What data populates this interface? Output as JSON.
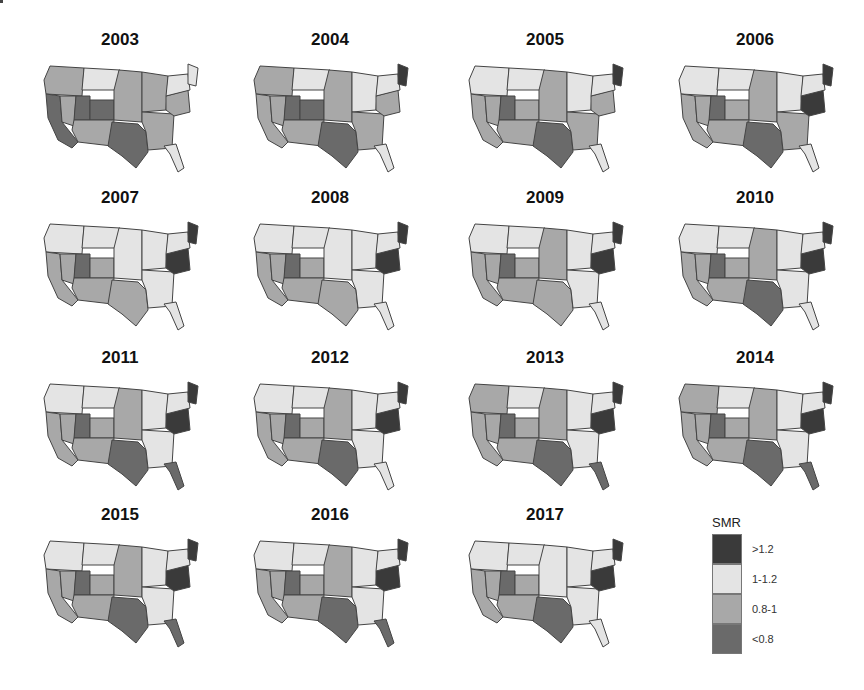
{
  "chart_data": {
    "type": "choropleth-small-multiples",
    "title": "",
    "legend": {
      "title": "SMR",
      "categories": [
        {
          "label": ">1.2",
          "color": "#3a3a3a"
        },
        {
          "label": "1-1.2",
          "color": "#e4e4e4"
        },
        {
          "label": "0.8-1",
          "color": "#a8a8a8"
        },
        {
          "label": "<0.8",
          "color": "#6a6a6a"
        }
      ]
    },
    "panels": [
      {
        "year": "2003",
        "regions": {
          "northwest": "0.8-1",
          "montana": "1-1.2",
          "california": "<0.8",
          "nevada": "0.8-1",
          "utah": "<0.8",
          "colorado": "<0.8",
          "southwest": "0.8-1",
          "texas": "<0.8",
          "plains": "0.8-1",
          "midwest": "0.8-1",
          "south": "0.8-1",
          "florida": "1-1.2",
          "appalachia": "0.8-1",
          "northeast": "1-1.2",
          "maine": "1-1.2"
        }
      },
      {
        "year": "2004",
        "regions": {
          "northwest": "0.8-1",
          "montana": "1-1.2",
          "california": "0.8-1",
          "nevada": "0.8-1",
          "utah": "<0.8",
          "colorado": "<0.8",
          "southwest": "0.8-1",
          "texas": "<0.8",
          "plains": "0.8-1",
          "midwest": "1-1.2",
          "south": "0.8-1",
          "florida": "1-1.2",
          "appalachia": "0.8-1",
          "northeast": "1-1.2",
          "maine": ">1.2"
        }
      },
      {
        "year": "2005",
        "regions": {
          "northwest": "1-1.2",
          "montana": "1-1.2",
          "california": "0.8-1",
          "nevada": "0.8-1",
          "utah": "<0.8",
          "colorado": "0.8-1",
          "southwest": "0.8-1",
          "texas": "<0.8",
          "plains": "0.8-1",
          "midwest": "1-1.2",
          "south": "0.8-1",
          "florida": "1-1.2",
          "appalachia": "0.8-1",
          "northeast": "1-1.2",
          "maine": ">1.2"
        }
      },
      {
        "year": "2006",
        "regions": {
          "northwest": "1-1.2",
          "montana": "1-1.2",
          "california": "0.8-1",
          "nevada": "0.8-1",
          "utah": "<0.8",
          "colorado": "0.8-1",
          "southwest": "0.8-1",
          "texas": "<0.8",
          "plains": "0.8-1",
          "midwest": "1-1.2",
          "south": "0.8-1",
          "florida": "1-1.2",
          "appalachia": ">1.2",
          "northeast": "1-1.2",
          "maine": ">1.2"
        }
      },
      {
        "year": "2007",
        "regions": {
          "northwest": "1-1.2",
          "montana": "1-1.2",
          "california": "0.8-1",
          "nevada": "0.8-1",
          "utah": "<0.8",
          "colorado": "0.8-1",
          "southwest": "0.8-1",
          "texas": "0.8-1",
          "plains": "1-1.2",
          "midwest": "1-1.2",
          "south": "1-1.2",
          "florida": "1-1.2",
          "appalachia": ">1.2",
          "northeast": "1-1.2",
          "maine": ">1.2"
        }
      },
      {
        "year": "2008",
        "regions": {
          "northwest": "1-1.2",
          "montana": "1-1.2",
          "california": "0.8-1",
          "nevada": "0.8-1",
          "utah": "<0.8",
          "colorado": "0.8-1",
          "southwest": "0.8-1",
          "texas": "0.8-1",
          "plains": "1-1.2",
          "midwest": "1-1.2",
          "south": "1-1.2",
          "florida": "1-1.2",
          "appalachia": ">1.2",
          "northeast": "1-1.2",
          "maine": ">1.2"
        }
      },
      {
        "year": "2009",
        "regions": {
          "northwest": "1-1.2",
          "montana": "1-1.2",
          "california": "0.8-1",
          "nevada": "0.8-1",
          "utah": "<0.8",
          "colorado": "0.8-1",
          "southwest": "0.8-1",
          "texas": "0.8-1",
          "plains": "0.8-1",
          "midwest": "1-1.2",
          "south": "1-1.2",
          "florida": "1-1.2",
          "appalachia": ">1.2",
          "northeast": "1-1.2",
          "maine": ">1.2"
        }
      },
      {
        "year": "2010",
        "regions": {
          "northwest": "1-1.2",
          "montana": "1-1.2",
          "california": "0.8-1",
          "nevada": "0.8-1",
          "utah": "<0.8",
          "colorado": "0.8-1",
          "southwest": "0.8-1",
          "texas": "<0.8",
          "plains": "0.8-1",
          "midwest": "1-1.2",
          "south": "1-1.2",
          "florida": "1-1.2",
          "appalachia": ">1.2",
          "northeast": "1-1.2",
          "maine": ">1.2"
        }
      },
      {
        "year": "2011",
        "regions": {
          "northwest": "1-1.2",
          "montana": "1-1.2",
          "california": "0.8-1",
          "nevada": "0.8-1",
          "utah": "<0.8",
          "colorado": "0.8-1",
          "southwest": "0.8-1",
          "texas": "<0.8",
          "plains": "0.8-1",
          "midwest": "1-1.2",
          "south": "1-1.2",
          "florida": "<0.8",
          "appalachia": ">1.2",
          "northeast": "1-1.2",
          "maine": ">1.2"
        }
      },
      {
        "year": "2012",
        "regions": {
          "northwest": "1-1.2",
          "montana": "1-1.2",
          "california": "0.8-1",
          "nevada": "0.8-1",
          "utah": "<0.8",
          "colorado": "0.8-1",
          "southwest": "0.8-1",
          "texas": "<0.8",
          "plains": "0.8-1",
          "midwest": "1-1.2",
          "south": "1-1.2",
          "florida": "1-1.2",
          "appalachia": ">1.2",
          "northeast": "1-1.2",
          "maine": ">1.2"
        }
      },
      {
        "year": "2013",
        "regions": {
          "northwest": "0.8-1",
          "montana": "1-1.2",
          "california": "0.8-1",
          "nevada": "0.8-1",
          "utah": "<0.8",
          "colorado": "0.8-1",
          "southwest": "0.8-1",
          "texas": "<0.8",
          "plains": "0.8-1",
          "midwest": "1-1.2",
          "south": "1-1.2",
          "florida": "<0.8",
          "appalachia": ">1.2",
          "northeast": "1-1.2",
          "maine": ">1.2"
        }
      },
      {
        "year": "2014",
        "regions": {
          "northwest": "0.8-1",
          "montana": "1-1.2",
          "california": "0.8-1",
          "nevada": "0.8-1",
          "utah": "<0.8",
          "colorado": "0.8-1",
          "southwest": "0.8-1",
          "texas": "<0.8",
          "plains": "0.8-1",
          "midwest": "1-1.2",
          "south": "1-1.2",
          "florida": "<0.8",
          "appalachia": ">1.2",
          "northeast": "1-1.2",
          "maine": ">1.2"
        }
      },
      {
        "year": "2015",
        "regions": {
          "northwest": "1-1.2",
          "montana": "1-1.2",
          "california": "0.8-1",
          "nevada": "0.8-1",
          "utah": "<0.8",
          "colorado": "0.8-1",
          "southwest": "0.8-1",
          "texas": "<0.8",
          "plains": "0.8-1",
          "midwest": "1-1.2",
          "south": "1-1.2",
          "florida": "<0.8",
          "appalachia": ">1.2",
          "northeast": "1-1.2",
          "maine": ">1.2"
        }
      },
      {
        "year": "2016",
        "regions": {
          "northwest": "1-1.2",
          "montana": "1-1.2",
          "california": "0.8-1",
          "nevada": "0.8-1",
          "utah": "<0.8",
          "colorado": "0.8-1",
          "southwest": "0.8-1",
          "texas": "<0.8",
          "plains": "0.8-1",
          "midwest": "1-1.2",
          "south": "1-1.2",
          "florida": "<0.8",
          "appalachia": ">1.2",
          "northeast": "1-1.2",
          "maine": ">1.2"
        }
      },
      {
        "year": "2017",
        "regions": {
          "northwest": "1-1.2",
          "montana": "1-1.2",
          "california": "0.8-1",
          "nevada": "0.8-1",
          "utah": "<0.8",
          "colorado": "0.8-1",
          "southwest": "0.8-1",
          "texas": "<0.8",
          "plains": "1-1.2",
          "midwest": "1-1.2",
          "south": "1-1.2",
          "florida": "1-1.2",
          "appalachia": ">1.2",
          "northeast": "1-1.2",
          "maine": ">1.2"
        }
      }
    ],
    "layout": {
      "rows": 4,
      "cols": 4,
      "legend_position": "bottom-right"
    }
  }
}
